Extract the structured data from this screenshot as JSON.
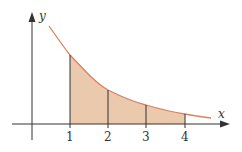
{
  "diagram": {
    "axes": {
      "x_label": "x",
      "y_label": "y"
    },
    "ticks": [
      {
        "label": "1",
        "px": 70,
        "curve_y": 55
      },
      {
        "label": "2",
        "px": 108,
        "curve_y": 90
      },
      {
        "label": "3",
        "px": 146,
        "curve_y": 105
      },
      {
        "label": "4",
        "px": 185,
        "curve_y": 114
      }
    ],
    "colors": {
      "curve": "#d9825f",
      "fill": "#eac9ad",
      "axis": "#333333"
    }
  }
}
